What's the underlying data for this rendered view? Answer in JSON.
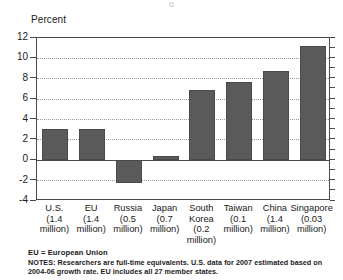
{
  "figure": {
    "unit_label": "Percent",
    "title_sliver": "g"
  },
  "chart_data": {
    "type": "bar",
    "title": "",
    "subtitle": "",
    "xlabel": "",
    "ylabel": "Percent",
    "ylim": [
      -4,
      12
    ],
    "yticks": [
      -4,
      -2,
      0,
      2,
      4,
      6,
      8,
      10,
      12
    ],
    "ytick_labels": [
      "-4",
      "-2",
      "0",
      "2",
      "4",
      "6",
      "8",
      "10",
      "12"
    ],
    "grid": "horizontal-dotted",
    "legend": "none",
    "bar_color": "#5a5a5a",
    "categories": [
      "U.S. (1.4 million)",
      "EU (1.4 million)",
      "Russia (0.5 million)",
      "Japan (0.7 million)",
      "South Korea (0.2 million)",
      "Taiwan (0.1 million)",
      "China (1.4 million)",
      "Singapore (0.03 million)"
    ],
    "category_lines": [
      [
        "U.S.",
        "(1.4",
        "million)"
      ],
      [
        "EU",
        "(1.4",
        "million)"
      ],
      [
        "Russia",
        "(0.5",
        "million)"
      ],
      [
        "Japan",
        "(0.7",
        "million)"
      ],
      [
        "South",
        "Korea",
        "(0.2",
        "million)"
      ],
      [
        "Taiwan",
        "(0.1",
        "million)"
      ],
      [
        "China",
        "(1.4",
        "million)"
      ],
      [
        "Singapore",
        "(0.03",
        "million)"
      ]
    ],
    "values": [
      3.1,
      3.1,
      -2.2,
      0.4,
      6.9,
      7.7,
      8.8,
      11.2
    ]
  },
  "footnotes": {
    "legend_note": "EU = European Union",
    "notes": "NOTES: Researchers are full-time equivalents. U.S. data for 2007 estimated based on 2004-06 growth rate. EU includes all 27 member states."
  }
}
